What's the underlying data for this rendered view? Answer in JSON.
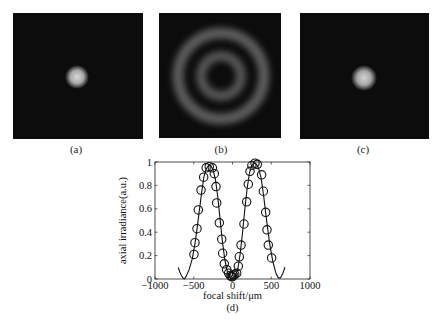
{
  "figure": {
    "panels": [
      {
        "id": "a",
        "caption": "(a)",
        "content": "single-bright-spot"
      },
      {
        "id": "b",
        "caption": "(b)",
        "content": "concentric-rings"
      },
      {
        "id": "c",
        "caption": "(c)",
        "content": "single-bright-spot"
      }
    ],
    "plot_caption": "(d)"
  },
  "chart_data": {
    "type": "line",
    "title": "",
    "xlabel": "focal shift/μm",
    "ylabel": "axial irradiance(a.u.)",
    "xlim": [
      -1000,
      1000
    ],
    "ylim": [
      0,
      1
    ],
    "xticks": [
      -1000,
      -500,
      0,
      500,
      1000
    ],
    "yticks": [
      0,
      0.2,
      0.4,
      0.6,
      0.8,
      1
    ],
    "ytick_labels": [
      "0",
      "0.2",
      "0.4",
      "0.6",
      "0.8",
      "1"
    ],
    "grid": false,
    "legend": null,
    "series": [
      {
        "name": "theory",
        "style": "solid-line",
        "x": [
          -700,
          -680,
          -660,
          -640,
          -620,
          -600,
          -560,
          -520,
          -480,
          -440,
          -400,
          -370,
          -340,
          -310,
          -280,
          -250,
          -220,
          -190,
          -160,
          -130,
          -100,
          -70,
          -40,
          -10,
          10,
          40,
          70,
          100,
          130,
          160,
          190,
          220,
          250,
          280,
          310,
          340,
          370,
          400,
          440,
          480,
          520,
          560,
          590,
          620,
          650,
          677
        ],
        "y": [
          0.1,
          0.06,
          0.03,
          0.01,
          0.0,
          0.02,
          0.08,
          0.17,
          0.32,
          0.52,
          0.73,
          0.87,
          0.94,
          0.97,
          0.97,
          0.93,
          0.85,
          0.7,
          0.51,
          0.32,
          0.17,
          0.07,
          0.02,
          0.0,
          0.0,
          0.03,
          0.09,
          0.22,
          0.4,
          0.6,
          0.78,
          0.91,
          0.97,
          0.99,
          0.98,
          0.94,
          0.86,
          0.72,
          0.5,
          0.3,
          0.15,
          0.05,
          0.01,
          0.01,
          0.05,
          0.1
        ]
      },
      {
        "name": "measured",
        "style": "open-circle-markers",
        "x": [
          -497,
          -484,
          -458,
          -441,
          -406,
          -372,
          -340,
          -300,
          -260,
          -235,
          -213,
          -204,
          -170,
          -139,
          -127,
          -106,
          -75,
          -50,
          -30,
          -15,
          0,
          15,
          30,
          54,
          75,
          88,
          110,
          148,
          183,
          204,
          226,
          250,
          290,
          320,
          376,
          398,
          428,
          445,
          462,
          505
        ],
        "y": [
          0.21,
          0.31,
          0.43,
          0.59,
          0.76,
          0.87,
          0.95,
          0.96,
          0.95,
          0.9,
          0.79,
          0.65,
          0.48,
          0.34,
          0.22,
          0.13,
          0.08,
          0.05,
          0.03,
          0.02,
          0.02,
          0.03,
          0.04,
          0.05,
          0.11,
          0.19,
          0.29,
          0.47,
          0.66,
          0.81,
          0.92,
          0.97,
          0.99,
          0.98,
          0.89,
          0.75,
          0.57,
          0.42,
          0.29,
          0.18
        ]
      }
    ]
  }
}
